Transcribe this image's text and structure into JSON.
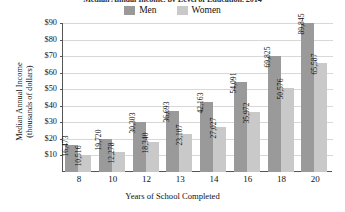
{
  "chart_data": {
    "type": "bar",
    "title": "Median Annual Income, by Level of Education, 2014",
    "xlabel": "Years of School Completed",
    "ylabel": "Median Annual Income (thousands of dollars)",
    "ylabel_line1": "Median Annual Income",
    "ylabel_line2": "(thousands of dollars)",
    "categories": [
      "8",
      "10",
      "12",
      "13",
      "14",
      "16",
      "18",
      "20"
    ],
    "series": [
      {
        "name": "Men",
        "color": "#9a9a9a",
        "values": [
          16473,
          19720,
          30303,
          36693,
          42163,
          54091,
          69825,
          89845
        ],
        "labels": [
          "16,473",
          "19,720",
          "30,303",
          "36,693",
          "42,163",
          "54,091",
          "69,825",
          "89,845"
        ]
      },
      {
        "name": "Women",
        "color": "#c9c9c9",
        "values": [
          10516,
          12278,
          18340,
          23107,
          27027,
          35972,
          50576,
          65587
        ],
        "labels": [
          "10,516",
          "12,278",
          "18,340",
          "23,107",
          "27,027",
          "35,972",
          "50,576",
          "65,587"
        ]
      }
    ],
    "ylim": [
      0,
      90000
    ],
    "yticks": [
      10000,
      20000,
      30000,
      40000,
      50000,
      60000,
      70000,
      80000,
      90000
    ],
    "ytick_labels": [
      "$10",
      "$20",
      "$30",
      "$40",
      "$50",
      "$60",
      "$70",
      "$80",
      "$90"
    ],
    "grid": true,
    "legend_position": "top-center"
  },
  "legend": {
    "entries": [
      {
        "label": "Men",
        "color": "#9a9a9a"
      },
      {
        "label": "Women",
        "color": "#c9c9c9"
      }
    ]
  }
}
